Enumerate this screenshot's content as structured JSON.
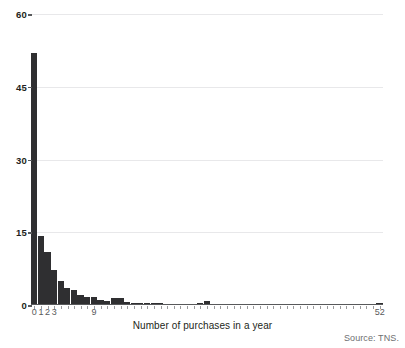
{
  "chart_data": {
    "type": "bar",
    "title": "",
    "subtitle": "",
    "xlabel": "Number of purchases in a year",
    "ylabel": "",
    "xlim": [
      -0.5,
      52.5
    ],
    "ylim": [
      0,
      60
    ],
    "grid": "horizontal",
    "legend": "none",
    "bar_color": "#2f2f31",
    "y_ticks": [
      0,
      15,
      30,
      45,
      60
    ],
    "y_tick_labels": [
      "0",
      "15",
      "30",
      "45",
      "60"
    ],
    "x_tick_labels": [
      "0",
      "1",
      "2",
      "3",
      "9",
      "52"
    ],
    "x_tick_label_positions": [
      0,
      1,
      2,
      3,
      9,
      52
    ],
    "categories": [
      0,
      1,
      2,
      3,
      4,
      5,
      6,
      7,
      8,
      9,
      10,
      11,
      12,
      13,
      14,
      15,
      16,
      17,
      18,
      19,
      20,
      21,
      22,
      23,
      24,
      25,
      26,
      27,
      28,
      29,
      30,
      31,
      32,
      33,
      34,
      35,
      36,
      37,
      38,
      39,
      40,
      41,
      42,
      43,
      44,
      45,
      46,
      47,
      48,
      49,
      50,
      51,
      52
    ],
    "values": [
      52.0,
      14.2,
      11.0,
      7.3,
      5.0,
      3.6,
      3.0,
      2.1,
      1.7,
      1.6,
      1.0,
      0.9,
      1.4,
      1.5,
      0.7,
      0.5,
      0.5,
      0.4,
      0.4,
      0.4,
      0.3,
      0.3,
      0.3,
      0.3,
      0.3,
      0.4,
      0.9,
      0.3,
      0.3,
      0.2,
      0.2,
      0.2,
      0.2,
      0.2,
      0.2,
      0.2,
      0.2,
      0.2,
      0.2,
      0.2,
      0.2,
      0.2,
      0.2,
      0.2,
      0.2,
      0.2,
      0.2,
      0.2,
      0.2,
      0.2,
      0.2,
      0.2,
      0.5
    ],
    "source": "Source: TNS."
  },
  "footer": {
    "source_note": "Source: TNS."
  }
}
